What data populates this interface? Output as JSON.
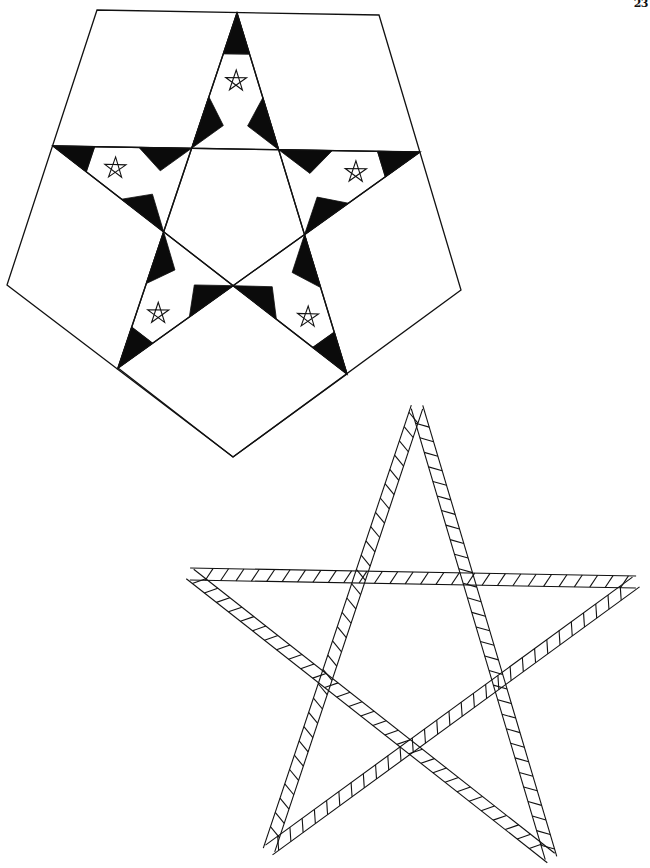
{
  "page": {
    "page_number": "23",
    "background": "#ffffff",
    "ink": "#111111"
  },
  "figures": [
    {
      "id": "pentagon-star-fractal",
      "description": "Pentagon containing a pentagram whose arm tips are black triangles and whose arms hold smaller nested pentagrams",
      "outer_pentagon": [
        [
          97,
          10
        ],
        [
          379,
          15
        ],
        [
          461,
          290
        ],
        [
          233,
          457
        ],
        [
          7,
          285
        ]
      ],
      "star_points": [
        [
          237,
          13
        ],
        [
          420,
          152
        ],
        [
          347,
          374
        ],
        [
          118,
          368
        ],
        [
          53,
          146
        ]
      ],
      "nested_stars": 5
    },
    {
      "id": "hatched-band-pentagram",
      "description": "Large pentagram drawn as a double-line band with diagonal hatch strokes",
      "points": [
        [
          417,
          407
        ],
        [
          636,
          582
        ],
        [
          551,
          858
        ],
        [
          269,
          850
        ],
        [
          190,
          574
        ]
      ],
      "band_width": 12
    }
  ]
}
